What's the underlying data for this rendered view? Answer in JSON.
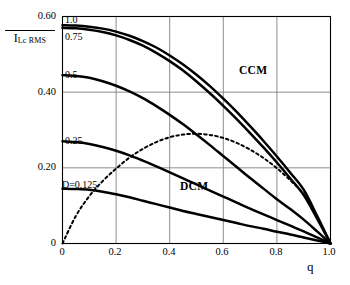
{
  "chart_data": {
    "type": "line",
    "title": "",
    "xlabel": "q",
    "ylabel": "I_Lc RMS",
    "ylabel_main": "I",
    "ylabel_sub": "Lc RMS",
    "ylabel_overline": true,
    "xlim": [
      0,
      1.0
    ],
    "ylim": [
      0,
      0.6
    ],
    "xticks": [
      0,
      0.2,
      0.4,
      0.6,
      0.8,
      1.0
    ],
    "xtick_labels": [
      "0",
      "0.2",
      "0.4",
      "0.6",
      "0.8",
      "1.0"
    ],
    "yticks": [
      0,
      0.2,
      0.4,
      0.6
    ],
    "ytick_labels": [
      "0",
      "0.20",
      "0.40",
      "0.60"
    ],
    "grid": true,
    "gridlines_x": [
      0.2,
      0.4,
      0.6,
      0.8
    ],
    "gridlines_y": [
      0.2,
      0.4
    ],
    "legend_position": "inline-curve-labels",
    "line_color": "#000000",
    "grid_color": "#808080",
    "axis_color": "#000000",
    "series": [
      {
        "name": "1.0",
        "label": "1.0",
        "style": "solid",
        "x": [
          0.0,
          0.05,
          0.1,
          0.15,
          0.2,
          0.25,
          0.3,
          0.35,
          0.4,
          0.45,
          0.5,
          0.55,
          0.6,
          0.65,
          0.7,
          0.75,
          0.8,
          0.85,
          0.9,
          0.95,
          1.0
        ],
        "y": [
          0.577,
          0.576,
          0.573,
          0.568,
          0.56,
          0.549,
          0.535,
          0.518,
          0.497,
          0.473,
          0.446,
          0.416,
          0.383,
          0.348,
          0.31,
          0.271,
          0.23,
          0.187,
          0.142,
          0.073,
          0.0
        ]
      },
      {
        "name": "0.75",
        "label": "0.75",
        "style": "solid",
        "x": [
          0.0,
          0.05,
          0.1,
          0.15,
          0.2,
          0.25,
          0.3,
          0.35,
          0.4,
          0.45,
          0.5,
          0.55,
          0.6,
          0.65,
          0.7,
          0.75,
          0.8,
          0.85,
          0.9,
          0.95,
          1.0
        ],
        "y": [
          0.57,
          0.569,
          0.565,
          0.559,
          0.55,
          0.538,
          0.523,
          0.504,
          0.482,
          0.457,
          0.428,
          0.397,
          0.364,
          0.329,
          0.292,
          0.254,
          0.214,
          0.172,
          0.128,
          0.066,
          0.0
        ]
      },
      {
        "name": "0.5",
        "label": "0.5",
        "style": "solid",
        "x": [
          0.0,
          0.05,
          0.1,
          0.15,
          0.2,
          0.25,
          0.3,
          0.35,
          0.4,
          0.45,
          0.5,
          0.55,
          0.6,
          0.65,
          0.7,
          0.75,
          0.8,
          0.85,
          0.9,
          0.95,
          1.0
        ],
        "y": [
          0.445,
          0.443,
          0.438,
          0.429,
          0.417,
          0.402,
          0.384,
          0.363,
          0.34,
          0.315,
          0.288,
          0.26,
          0.231,
          0.202,
          0.173,
          0.145,
          0.117,
          0.091,
          0.063,
          0.032,
          0.0
        ]
      },
      {
        "name": "0.25",
        "label": "0.25",
        "style": "solid",
        "x": [
          0.0,
          0.05,
          0.1,
          0.15,
          0.2,
          0.25,
          0.3,
          0.35,
          0.4,
          0.45,
          0.5,
          0.55,
          0.6,
          0.65,
          0.7,
          0.75,
          0.8,
          0.85,
          0.9,
          0.95,
          1.0
        ],
        "y": [
          0.27,
          0.268,
          0.263,
          0.255,
          0.245,
          0.233,
          0.219,
          0.204,
          0.188,
          0.172,
          0.156,
          0.14,
          0.124,
          0.108,
          0.092,
          0.077,
          0.062,
          0.047,
          0.032,
          0.016,
          0.0
        ]
      },
      {
        "name": "D=0.125",
        "label": "D=0.125",
        "style": "solid",
        "x": [
          0.0,
          0.05,
          0.1,
          0.15,
          0.2,
          0.25,
          0.3,
          0.35,
          0.4,
          0.45,
          0.5,
          0.55,
          0.6,
          0.65,
          0.7,
          0.75,
          0.8,
          0.85,
          0.9,
          0.95,
          1.0
        ],
        "y": [
          0.145,
          0.144,
          0.142,
          0.137,
          0.13,
          0.122,
          0.113,
          0.104,
          0.095,
          0.086,
          0.078,
          0.07,
          0.062,
          0.054,
          0.046,
          0.039,
          0.031,
          0.024,
          0.016,
          0.008,
          0.0
        ]
      },
      {
        "name": "CCM-DCM boundary",
        "label": "",
        "style": "dashed",
        "x": [
          0.0,
          0.05,
          0.1,
          0.15,
          0.2,
          0.25,
          0.3,
          0.35,
          0.4,
          0.45,
          0.5,
          0.55,
          0.6,
          0.65,
          0.7,
          0.75,
          0.8,
          0.85,
          0.9,
          0.95,
          1.0
        ],
        "y": [
          0.0,
          0.073,
          0.125,
          0.165,
          0.198,
          0.227,
          0.25,
          0.268,
          0.281,
          0.288,
          0.29,
          0.287,
          0.279,
          0.266,
          0.248,
          0.226,
          0.199,
          0.167,
          0.13,
          0.07,
          0.0
        ]
      }
    ],
    "annotations": [
      {
        "text": "CCM",
        "x": 0.735,
        "y": 0.455
      },
      {
        "text": "DCM",
        "x": 0.455,
        "y": 0.165
      }
    ]
  },
  "curve_labels": [
    {
      "text": "1.0"
    },
    {
      "text": "0.75"
    },
    {
      "text": "0.5"
    },
    {
      "text": "0.25"
    },
    {
      "text": "D=0.125"
    }
  ],
  "regions": [
    {
      "text": "CCM"
    },
    {
      "text": "DCM"
    }
  ],
  "axes": {
    "ylabel_main": "I",
    "ylabel_sub": "Lc RMS",
    "xlabel": "q",
    "ytick_labels": [
      "0.60",
      "0.40",
      "0.20",
      "0"
    ],
    "xtick_labels": [
      "0",
      "0.2",
      "0.4",
      "0.6",
      "0.8",
      "1.0"
    ]
  }
}
